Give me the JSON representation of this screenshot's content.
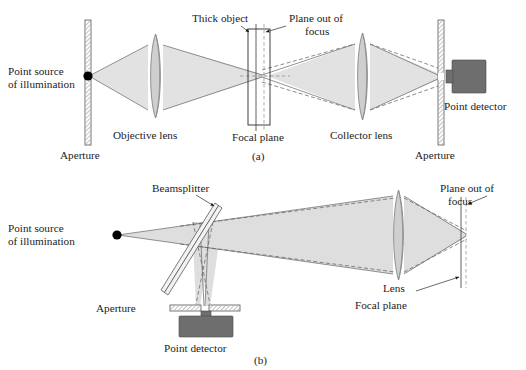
{
  "figure": {
    "background_color": "#ffffff",
    "beam_fill_color": "#e2e2e2",
    "lens_fill_color": "#cfcfcf",
    "detector_color": "#6e6e6e",
    "line_color": "#5a5a5a"
  },
  "panel_a": {
    "panel_label": "(a)",
    "labels": {
      "point_source_line1": "Point source",
      "point_source_line2": "of illumination",
      "aperture_left": "Aperture",
      "objective_lens": "Objective lens",
      "thick_object": "Thick object",
      "plane_out_of_focus_line1": "Plane out of",
      "plane_out_of_focus_line2": "focus",
      "focal_plane": "Focal plane",
      "collector_lens": "Collector lens",
      "aperture_right": "Aperture",
      "point_detector": "Point detector"
    }
  },
  "panel_b": {
    "panel_label": "(b)",
    "labels": {
      "point_source_line1": "Point source",
      "point_source_line2": "of illumination",
      "beamsplitter": "Beamsplitter",
      "aperture": "Aperture",
      "point_detector": "Point detector",
      "lens": "Lens",
      "focal_plane": "Focal plane",
      "plane_out_of_focus_line1": "Plane out of",
      "plane_out_of_focus_line2": "focus"
    }
  }
}
